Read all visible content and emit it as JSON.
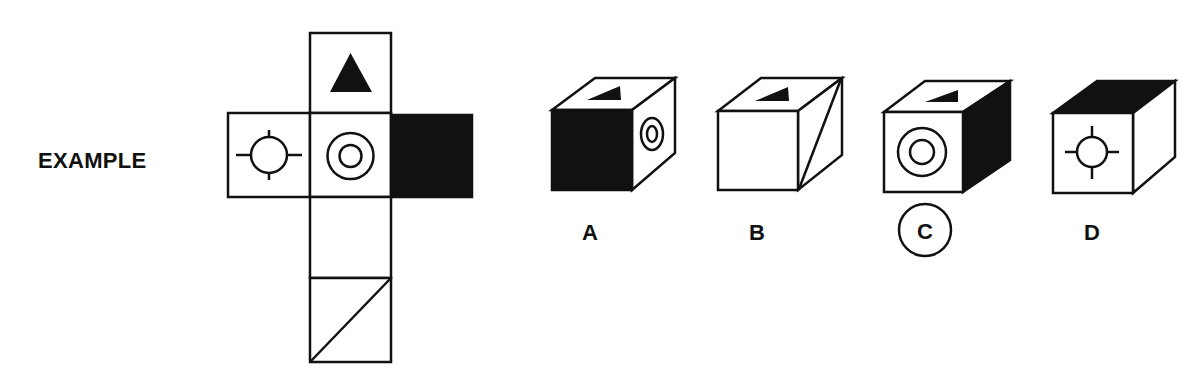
{
  "example_label": "EXAMPLE",
  "net": {
    "faces": [
      {
        "position": "top",
        "symbol": "black-triangle"
      },
      {
        "position": "left",
        "symbol": "crosshair-circle"
      },
      {
        "position": "center",
        "symbol": "concentric-circles"
      },
      {
        "position": "right",
        "symbol": "solid-black"
      },
      {
        "position": "below-center",
        "symbol": "blank"
      },
      {
        "position": "bottom",
        "symbol": "diagonal-line"
      }
    ]
  },
  "options": [
    {
      "label": "A",
      "front": "solid-black",
      "top": "black-triangle",
      "side": "concentric-circles",
      "selected": false
    },
    {
      "label": "B",
      "front": "blank",
      "top": "black-triangle",
      "side": "diagonal-line",
      "selected": false
    },
    {
      "label": "C",
      "front": "concentric-circles",
      "top": "black-triangle",
      "side": "solid-black",
      "selected": true
    },
    {
      "label": "D",
      "front": "crosshair-circle",
      "top": "solid-black",
      "side": "blank",
      "selected": false
    }
  ],
  "colors": {
    "ink": "#111111",
    "background": "#ffffff"
  }
}
